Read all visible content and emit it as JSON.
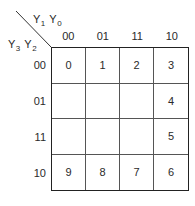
{
  "kmap": {
    "column_variable": {
      "name": "Y",
      "subscripts": [
        "1",
        "0"
      ]
    },
    "row_variable": {
      "name": "Y",
      "subscripts": [
        "3",
        "2"
      ]
    },
    "column_headers": [
      "00",
      "01",
      "11",
      "10"
    ],
    "row_headers": [
      "00",
      "01",
      "11",
      "10"
    ],
    "cells": [
      [
        "0",
        "1",
        "2",
        "3"
      ],
      [
        "",
        "",
        "",
        "4"
      ],
      [
        "",
        "",
        "",
        "5"
      ],
      [
        "9",
        "8",
        "7",
        "6"
      ]
    ]
  },
  "colors": {
    "line": "#222222",
    "text": "#2a2a2a",
    "background": "#ffffff"
  }
}
